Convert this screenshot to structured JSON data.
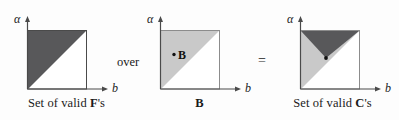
{
  "figure": {
    "background_color": "#fdfdfd",
    "dark_fill": "#58585a",
    "light_fill": "#c9c9c9",
    "axis_color": "#4a4a4a",
    "text_color": "#1a1a1a"
  },
  "panels": [
    {
      "id": "valid-f",
      "caption_prefix": "Set of valid ",
      "caption_symbol": "F",
      "caption_suffix": "'s",
      "y_axis_label": "α",
      "x_axis_label": "b",
      "regions": [
        {
          "name": "upper-left-triangle",
          "fill": "#58585a"
        }
      ],
      "point_label": "",
      "has_point": false
    },
    {
      "id": "set-b",
      "caption_prefix": "",
      "caption_symbol": "B",
      "caption_suffix": "",
      "y_axis_label": "α",
      "x_axis_label": "b",
      "regions": [
        {
          "name": "upper-left-triangle",
          "fill": "#c9c9c9"
        }
      ],
      "point_label": "B",
      "has_point": true
    },
    {
      "id": "valid-c",
      "caption_prefix": "Set of valid ",
      "caption_symbol": "C",
      "caption_suffix": "'s",
      "y_axis_label": "α",
      "x_axis_label": "b",
      "regions": [
        {
          "name": "upper-left-triangle",
          "fill": "#c9c9c9"
        },
        {
          "name": "top-wedge-triangle",
          "fill": "#58585a"
        }
      ],
      "point_label": "",
      "has_point": true
    }
  ],
  "connectors": {
    "over": "over",
    "equals": "="
  }
}
